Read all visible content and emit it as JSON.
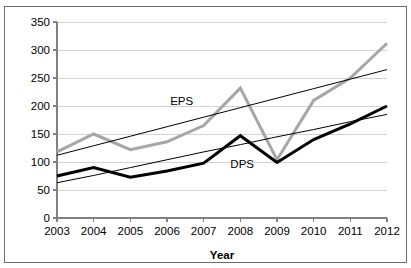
{
  "chart_data": {
    "type": "line",
    "title": "",
    "xlabel": "Year",
    "ylabel": "",
    "categories": [
      "2003",
      "2004",
      "2005",
      "2006",
      "2007",
      "2008",
      "2009",
      "2010",
      "2011",
      "2012"
    ],
    "x": [
      2003,
      2004,
      2005,
      2006,
      2007,
      2008,
      2009,
      2010,
      2011,
      2012
    ],
    "xlim": [
      2003,
      2012
    ],
    "ylim": [
      0,
      350
    ],
    "y_ticks": [
      0,
      50,
      100,
      150,
      200,
      250,
      300,
      350
    ],
    "y_tick_labels": [
      "0",
      "50",
      "100",
      "150",
      "200",
      "250",
      "300",
      "350"
    ],
    "grid": true,
    "legend": "inline-annotations",
    "series": [
      {
        "name": "EPS",
        "color": "#a6a6a6",
        "style": "solid",
        "width": 3,
        "values": [
          118,
          150,
          122,
          136,
          165,
          232,
          104,
          210,
          250,
          312
        ],
        "annotation": "EPS",
        "annotation_x": 2006.4,
        "annotation_y": 201
      },
      {
        "name": "DPS",
        "color": "#000000",
        "style": "solid",
        "width": 3,
        "values": [
          75,
          90,
          73,
          84,
          98,
          147,
          99,
          140,
          168,
          200
        ],
        "annotation": "DPS",
        "annotation_x": 2008.05,
        "annotation_y": 89
      },
      {
        "name": "EPS trendline",
        "color": "#000000",
        "style": "solid",
        "width": 1,
        "values": [
          112,
          129,
          146,
          163,
          180,
          197,
          214,
          231,
          248,
          265
        ],
        "annotation": "",
        "annotation_x": null,
        "annotation_y": null
      },
      {
        "name": "DPS trendline",
        "color": "#000000",
        "style": "solid",
        "width": 1,
        "values": [
          63,
          76,
          90,
          104,
          118,
          131,
          145,
          158,
          172,
          185
        ],
        "annotation": "",
        "annotation_x": null,
        "annotation_y": null
      }
    ],
    "annotations": [
      {
        "text": "EPS",
        "x": 2006.4,
        "y": 201
      },
      {
        "text": "DPS",
        "x": 2008.05,
        "y": 89
      }
    ]
  },
  "colors": {
    "eps_line": "#a6a6a6",
    "dps_line": "#000000",
    "trendline": "#000000",
    "gridline": "#d2d2d2",
    "axis": "#808080",
    "frame": "#6e6e6e",
    "background": "#ffffff"
  }
}
